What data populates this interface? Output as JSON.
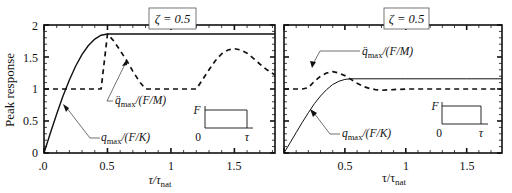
{
  "figure": {
    "ylabel": "Peak response",
    "xlabel_main": "τ/τ",
    "xlabel_sub": "nat",
    "origin_label": ".0"
  },
  "chart_data": [
    {
      "type": "line",
      "panel": "left",
      "title": "ζ = 0.5",
      "xlabel": "τ/τnat",
      "ylabel": "Peak response",
      "xlim": [
        0,
        1.82
      ],
      "ylim": [
        0,
        2
      ],
      "xticks": [
        0,
        0.5,
        1,
        1.5
      ],
      "xtick_labels": [
        ".0",
        "0.5",
        "1",
        "1.5"
      ],
      "yticks": [
        0,
        0.5,
        1,
        1.5,
        2
      ],
      "ytick_labels": [
        "0",
        "0.5",
        "1",
        "1.5",
        "2"
      ],
      "grid": false,
      "series": [
        {
          "name": "q_max/(F/K)",
          "label_main": "q",
          "label_sub": "max",
          "label_rest": "/(F/K)",
          "style": "solid",
          "x": [
            0,
            0.05,
            0.1,
            0.15,
            0.2,
            0.25,
            0.3,
            0.35,
            0.4,
            0.45,
            0.5,
            0.55,
            0.6,
            1.0,
            1.5,
            1.82
          ],
          "y": [
            0,
            0.31,
            0.61,
            0.89,
            1.14,
            1.36,
            1.54,
            1.68,
            1.78,
            1.84,
            1.86,
            1.86,
            1.86,
            1.86,
            1.86,
            1.86
          ]
        },
        {
          "name": "q̈_max/(F/M)",
          "label_main": "q̈",
          "label_sub": "max",
          "label_rest": "/(F/M)",
          "style": "dashed",
          "x": [
            0,
            0.1,
            0.2,
            0.3,
            0.35,
            0.4,
            0.45,
            0.5,
            0.55,
            0.6,
            0.65,
            0.7,
            0.75,
            0.8,
            1.0,
            1.2,
            1.25,
            1.3,
            1.35,
            1.4,
            1.45,
            1.5,
            1.55,
            1.6,
            1.65,
            1.7,
            1.75,
            1.82
          ],
          "y": [
            1.0,
            1.0,
            1.0,
            1.0,
            1.0,
            1.0,
            1.0,
            1.86,
            1.75,
            1.6,
            1.45,
            1.28,
            1.12,
            1.0,
            1.0,
            1.0,
            1.15,
            1.3,
            1.44,
            1.55,
            1.61,
            1.63,
            1.61,
            1.56,
            1.48,
            1.39,
            1.31,
            1.22
          ]
        }
      ],
      "annotations": [
        {
          "text": "q̈max/(F/M)",
          "arrow_to": [
            0.65,
            1.47
          ]
        },
        {
          "text": "qmax/(F/K)",
          "arrow_to": [
            0.15,
            0.76
          ]
        }
      ],
      "inset": {
        "F_label": "F",
        "zero_label": "0",
        "tau_label": "τ",
        "shape": "rectangular pulse"
      }
    },
    {
      "type": "line",
      "panel": "right",
      "title": "ζ = 0.5",
      "xlabel": "τ/τnat",
      "ylabel": "",
      "xlim": [
        0,
        1.79
      ],
      "ylim": [
        0,
        2
      ],
      "xticks": [
        0.5,
        1,
        1.5
      ],
      "xtick_labels": [
        "0.5",
        "1",
        "1.5"
      ],
      "yticks": [
        0,
        0.5,
        1,
        1.5,
        2
      ],
      "ytick_labels": [],
      "grid": false,
      "series": [
        {
          "name": "q_max/(F/K)",
          "label_main": "q",
          "label_sub": "max",
          "label_rest": "/(F/K)",
          "style": "solid",
          "x": [
            0,
            0.05,
            0.1,
            0.15,
            0.2,
            0.25,
            0.3,
            0.35,
            0.4,
            0.45,
            0.5,
            0.55,
            0.6,
            1.0,
            1.5,
            1.79
          ],
          "y": [
            0,
            0.16,
            0.32,
            0.48,
            0.63,
            0.77,
            0.89,
            0.99,
            1.07,
            1.12,
            1.15,
            1.16,
            1.16,
            1.16,
            1.16,
            1.16
          ]
        },
        {
          "name": "q̈_max/(F/M)",
          "label_main": "q̈",
          "label_sub": "max",
          "label_rest": "/(F/M)",
          "style": "dashed",
          "x": [
            0,
            0.1,
            0.15,
            0.2,
            0.25,
            0.3,
            0.35,
            0.4,
            0.45,
            0.5,
            0.55,
            0.6,
            0.65,
            0.7,
            0.75,
            0.8,
            0.9,
            1.0,
            1.2,
            1.5,
            1.79
          ],
          "y": [
            1.0,
            1.0,
            1.0,
            1.02,
            1.12,
            1.2,
            1.25,
            1.27,
            1.25,
            1.21,
            1.15,
            1.09,
            1.04,
            1.01,
            0.99,
            0.98,
            0.99,
            1.0,
            1.0,
            1.0,
            1.0
          ]
        }
      ],
      "annotations": [
        {
          "text": "q̈max/(F/M)",
          "arrow_to": [
            0.4,
            1.3
          ]
        },
        {
          "text": "qmax/(F/K)",
          "arrow_to": [
            0.22,
            0.68
          ]
        }
      ],
      "inset": {
        "F_label": "F",
        "zero_label": "0",
        "tau_label": "τ",
        "shape": "rectangular pulse"
      }
    }
  ]
}
